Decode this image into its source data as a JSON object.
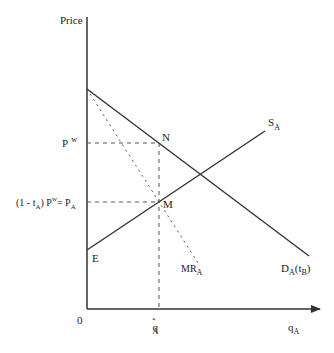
{
  "diagram": {
    "type": "economics-supply-demand",
    "axes": {
      "y_label": "Price",
      "x_label_main": "q",
      "x_label_sub": "A",
      "origin_label": "0"
    },
    "price_levels": {
      "world_price_main": "P",
      "world_price_sup": "w",
      "domestic_price_prefix": "(1 - t",
      "domestic_price_prefix_sub": "A",
      "domestic_price_mid": ") P",
      "domestic_price_mid_sup": "w",
      "domestic_price_eq": "= P",
      "domestic_price_eq_sub": "A"
    },
    "quantity_marker": {
      "main": "q",
      "sup": "*",
      "sub": "A"
    },
    "curves": {
      "supply": {
        "main": "S",
        "sub": "A"
      },
      "demand": {
        "main": "D",
        "sub": "A",
        "paren_open": "(t",
        "paren_sub": "B",
        "paren_close": ")"
      },
      "marginal_revenue": {
        "main": "MR",
        "sub": "A"
      }
    },
    "points": {
      "n": "N",
      "m": "M",
      "e": "E"
    },
    "colors": {
      "line": "#333333",
      "dashed": "#555555",
      "background": "#ffffff"
    }
  }
}
